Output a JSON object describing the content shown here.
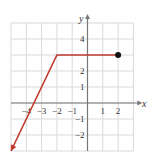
{
  "chart_data": {
    "type": "line",
    "title": "",
    "xlabel": "x",
    "ylabel": "y",
    "xlim": [
      -5,
      3
    ],
    "ylim": [
      -3,
      5
    ],
    "grid": true,
    "x_tick_labels": [
      "-4",
      "-3",
      "-2",
      "-1",
      "1",
      "2"
    ],
    "y_tick_labels": [
      "4",
      "2",
      "1",
      "-1",
      "-2"
    ],
    "series": [
      {
        "name": "piecewise",
        "color": "#c0392b",
        "points": [
          [
            -5,
            -3
          ],
          [
            -2,
            3
          ],
          [
            2,
            3
          ]
        ],
        "left_end": "arrow",
        "right_end": "closed-dot"
      }
    ]
  },
  "colors": {
    "curve": "#c0392b",
    "grid": "#d9d9d9",
    "axis": "#777777",
    "dot": "#111111"
  },
  "labels": {
    "x_axis": "x",
    "y_axis": "y"
  }
}
